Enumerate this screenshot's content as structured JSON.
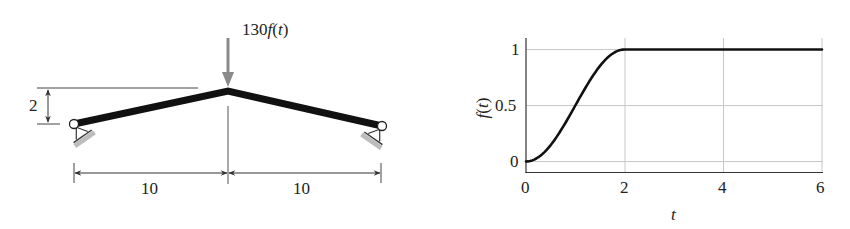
{
  "frame": {
    "load_label": "130f(t)",
    "load_prefix": "130",
    "load_func": "f",
    "load_arg_open": "(",
    "load_arg": "t",
    "load_arg_close": ")",
    "rise_dimension": "2",
    "span_left": "10",
    "span_right": "10",
    "colors": {
      "member": "#111111",
      "load_arrow": "#8a8a8a",
      "ground": "#bdbdbd",
      "dim_line": "#333333"
    }
  },
  "chart_data": {
    "type": "line",
    "title": "",
    "xlabel": "t",
    "ylabel": "f(t)",
    "xlim": [
      0,
      6
    ],
    "ylim": [
      -0.08,
      1.08
    ],
    "grid": true,
    "xticks": [
      0,
      2,
      4,
      6
    ],
    "xtick_labels": [
      "0",
      "2",
      "4",
      "6"
    ],
    "yticks": [
      0,
      0.5,
      1
    ],
    "ytick_labels": [
      "0",
      "0.5",
      "1"
    ],
    "series": [
      {
        "name": "f(t)",
        "x": [
          0,
          0.25,
          0.5,
          0.75,
          1.0,
          1.25,
          1.5,
          1.75,
          2.0,
          3.0,
          4.0,
          5.0,
          6.0
        ],
        "y": [
          0,
          0.038,
          0.146,
          0.309,
          0.5,
          0.691,
          0.854,
          0.962,
          1.0,
          1.0,
          1.0,
          1.0,
          1.0
        ],
        "color": "#111111"
      }
    ]
  }
}
